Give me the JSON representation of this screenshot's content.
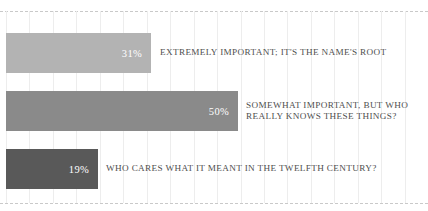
{
  "chart_data": {
    "type": "bar",
    "orientation": "horizontal",
    "title": "",
    "subtitle": "",
    "xlabel": "",
    "ylabel": "",
    "xlim": [
      0,
      100
    ],
    "grid": "vertical-light-dashed-bounds",
    "legend": "none",
    "categories": [
      "EXTREMELY IMPORTANT; IT'S THE NAME'S ROOT",
      "SOMEWHAT IMPORTANT, BUT WHO\nREALLY KNOWS THESE THINGS?",
      "WHO CARES WHAT IT MEANT IN THE TWELFTH CENTURY?"
    ],
    "values": [
      31,
      50,
      19
    ],
    "value_labels": [
      "31%",
      "50%",
      "19%"
    ],
    "colors": [
      "#b3b3b3",
      "#8a8a8a",
      "#595959"
    ],
    "value_label_color": "#ffffff",
    "category_label_color": "#4f4f4f",
    "background": "#ffffff",
    "grid_color": "#ededed",
    "rule_color": "#c9c9c9"
  },
  "bars": [
    {
      "value_label": "31%",
      "category": "EXTREMELY IMPORTANT; IT'S THE NAME'S ROOT",
      "color": "#b3b3b3",
      "width_px": 145,
      "top_px": 33,
      "label_left_px": 160
    },
    {
      "value_label": "50%",
      "category": "SOMEWHAT IMPORTANT, BUT WHO\nREALLY KNOWS THESE THINGS?",
      "color": "#8a8a8a",
      "width_px": 232,
      "top_px": 91,
      "label_left_px": 246
    },
    {
      "value_label": "19%",
      "category": "WHO CARES WHAT IT MEANT IN THE TWELFTH CENTURY?",
      "color": "#595959",
      "width_px": 92,
      "top_px": 149,
      "label_left_px": 106
    }
  ],
  "grid": {
    "vertical_line_count": 19,
    "first_x_px": 6,
    "spacing_px": 23.45,
    "top_rule_y_px": 11,
    "bottom_rule_y_px": 203
  }
}
